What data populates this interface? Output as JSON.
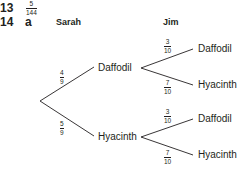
{
  "q13": {
    "number": "13",
    "answer": {
      "numerator": "5",
      "denominator": "144"
    }
  },
  "q14": {
    "number": "14",
    "part": "a",
    "headers": {
      "first": "Sarah",
      "second": "Jim"
    },
    "tree": {
      "first_branches": [
        {
          "label": "Daffodil",
          "prob": {
            "numerator": "4",
            "denominator": "9"
          }
        },
        {
          "label": "Hyacinth",
          "prob": {
            "numerator": "5",
            "denominator": "9"
          }
        }
      ],
      "second_branches": [
        [
          {
            "label": "Daffodil",
            "prob": {
              "numerator": "3",
              "denominator": "10"
            }
          },
          {
            "label": "Hyacinth",
            "prob": {
              "numerator": "7",
              "denominator": "10"
            }
          }
        ],
        [
          {
            "label": "Daffodil",
            "prob": {
              "numerator": "3",
              "denominator": "10"
            }
          },
          {
            "label": "Hyacinth",
            "prob": {
              "numerator": "7",
              "denominator": "10"
            }
          }
        ]
      ]
    }
  }
}
